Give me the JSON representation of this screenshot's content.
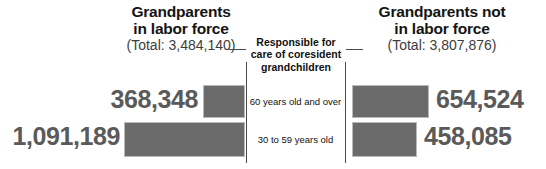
{
  "chart_data": {
    "type": "bar",
    "title": "",
    "orientation": "horizontal-diverging",
    "categories": [
      "60 years old and over",
      "30 to 59 years old"
    ],
    "category_axis_title": "Responsible for care of coresident grandchildren",
    "series": [
      {
        "name": "Grandparents in labor force",
        "total_label": "(Total: 3,484,140)",
        "total": 3484140,
        "side": "left",
        "values": [
          368348,
          1091189
        ],
        "value_labels": [
          "368,348",
          "1,091,189"
        ]
      },
      {
        "name": "Grandparents not in labor force",
        "total_label": "(Total: 3,807,876)",
        "total": 3807876,
        "side": "right",
        "values": [
          654524,
          458085
        ],
        "value_labels": [
          "654,524",
          "458,085"
        ]
      }
    ],
    "grid": false,
    "legend": "none",
    "colors": {
      "bar_fill": "#6b6b6b",
      "bar_stroke": "#b9b9b9",
      "value_text": "#5a5a5a",
      "heading_text": "#141414",
      "total_text": "#3d3d3d",
      "rule": "#4a4a4a",
      "background": "#ffffff"
    }
  },
  "panels": {
    "left": {
      "title_line1": "Grandparents",
      "title_line2": "in labor force",
      "total": "(Total: 3,484,140)"
    },
    "right": {
      "title_line1": "Grandparents not",
      "title_line2": "in labor force",
      "total": "(Total: 3,807,876)"
    }
  },
  "center": {
    "heading_line1": "Responsible for",
    "heading_line2": "care of coresident",
    "heading_line3": "grandchildren",
    "rows": [
      "60 years old and over",
      "30 to 59 years old"
    ]
  },
  "values": {
    "left": [
      "368,348",
      "1,091,189"
    ],
    "right": [
      "654,524",
      "458,085"
    ]
  }
}
